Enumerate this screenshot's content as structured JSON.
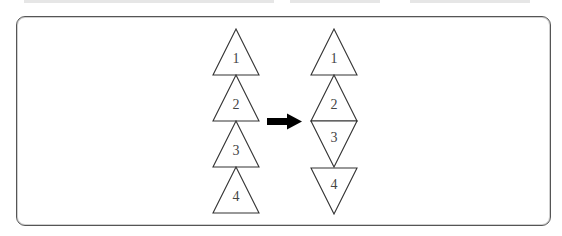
{
  "header": {
    "cutoff_text_visible": false
  },
  "diagram": {
    "left_column": {
      "orientation": [
        "up",
        "up",
        "up",
        "up"
      ],
      "labels": [
        "1",
        "2",
        "3",
        "4"
      ]
    },
    "arrow": {
      "direction": "right",
      "color": "#000000"
    },
    "right_column": {
      "orientation": [
        "up",
        "up",
        "down",
        "down"
      ],
      "labels": [
        "1",
        "2",
        "3",
        "4"
      ]
    },
    "stroke_color": "#333333",
    "frame_border_color": "#555555"
  }
}
